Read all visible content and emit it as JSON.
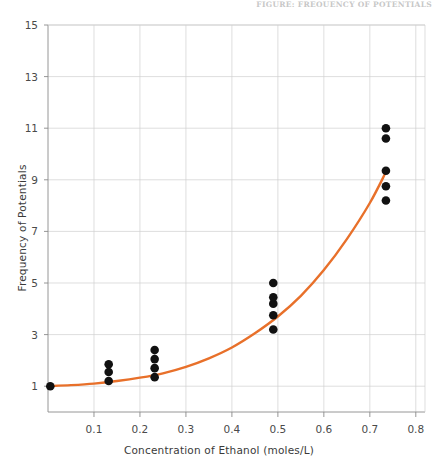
{
  "header": {
    "running_text": "FIGURE: FREQUENCY OF POTENTIALS"
  },
  "axis_titles": {
    "x": "Concentration of Ethanol  (moles/L)",
    "y": "Frequency of Potentials"
  },
  "colors": {
    "curve": "#E8702A",
    "points": "#111111",
    "grid": "#d0d0d0",
    "axis": "#8a8a8a",
    "text": "#3a3a3a"
  },
  "chart_data": {
    "type": "scatter",
    "title": "",
    "xlabel": "Concentration of Ethanol  (moles/L)",
    "ylabel": "Frequency of Potentials",
    "xlim": [
      0.0,
      0.82
    ],
    "ylim": [
      0.0,
      15.0
    ],
    "grid": true,
    "legend": "none",
    "xticks": [
      0.1,
      0.2,
      0.3,
      0.4,
      0.5,
      0.6,
      0.7,
      0.8
    ],
    "xtick_labels": [
      "0.1",
      "0.2",
      "0.3",
      "0.4",
      "0.5",
      "0.6",
      "0.7",
      "0.8"
    ],
    "yticks": [
      1,
      3,
      5,
      7,
      9,
      11,
      13,
      15
    ],
    "ytick_labels": [
      "1",
      "3",
      "5",
      "7",
      "9",
      "11",
      "13",
      "15"
    ],
    "series": [
      {
        "name": "Observed potentials",
        "marker": "filled-circle",
        "color": "#111111",
        "points": [
          {
            "x": 0.005,
            "y": 1.0
          },
          {
            "x": 0.132,
            "y": 1.2
          },
          {
            "x": 0.132,
            "y": 1.55
          },
          {
            "x": 0.132,
            "y": 1.85
          },
          {
            "x": 0.232,
            "y": 1.35
          },
          {
            "x": 0.232,
            "y": 1.7
          },
          {
            "x": 0.232,
            "y": 2.05
          },
          {
            "x": 0.232,
            "y": 2.4
          },
          {
            "x": 0.49,
            "y": 3.2
          },
          {
            "x": 0.49,
            "y": 3.75
          },
          {
            "x": 0.49,
            "y": 4.2
          },
          {
            "x": 0.49,
            "y": 4.45
          },
          {
            "x": 0.49,
            "y": 5.0
          },
          {
            "x": 0.735,
            "y": 8.2
          },
          {
            "x": 0.735,
            "y": 8.75
          },
          {
            "x": 0.735,
            "y": 9.35
          },
          {
            "x": 0.735,
            "y": 10.6
          },
          {
            "x": 0.735,
            "y": 11.0
          }
        ]
      },
      {
        "name": "Fitted exponential curve",
        "marker": "none",
        "line": "solid",
        "color": "#E8702A",
        "points": [
          {
            "x": 0.0,
            "y": 1.0
          },
          {
            "x": 0.05,
            "y": 1.04
          },
          {
            "x": 0.1,
            "y": 1.1
          },
          {
            "x": 0.15,
            "y": 1.2
          },
          {
            "x": 0.2,
            "y": 1.33
          },
          {
            "x": 0.25,
            "y": 1.5
          },
          {
            "x": 0.3,
            "y": 1.75
          },
          {
            "x": 0.35,
            "y": 2.08
          },
          {
            "x": 0.4,
            "y": 2.5
          },
          {
            "x": 0.45,
            "y": 3.05
          },
          {
            "x": 0.5,
            "y": 3.7
          },
          {
            "x": 0.55,
            "y": 4.5
          },
          {
            "x": 0.6,
            "y": 5.5
          },
          {
            "x": 0.65,
            "y": 6.7
          },
          {
            "x": 0.7,
            "y": 8.1
          },
          {
            "x": 0.735,
            "y": 9.3
          }
        ]
      }
    ]
  }
}
